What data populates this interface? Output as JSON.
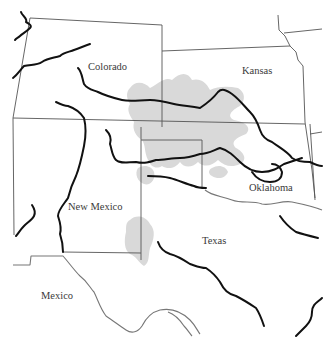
{
  "map": {
    "type": "regional outline map",
    "labels": {
      "colorado": "Colorado",
      "kansas": "Kansas",
      "new_mexico": "New Mexico",
      "oklahoma": "Oklahoma",
      "texas": "Texas",
      "mexico": "Mexico"
    },
    "colors": {
      "background": "#ffffff",
      "shaded_region": "#d9d9d9",
      "rivers": "#111111",
      "state_borders": "#555555",
      "international_border": "#777777"
    },
    "features": [
      "state borders",
      "rivers",
      "shaded region spanning eastern Colorado, western Kansas, Oklahoma panhandle, Texas panhandle and eastern New Mexico"
    ]
  }
}
